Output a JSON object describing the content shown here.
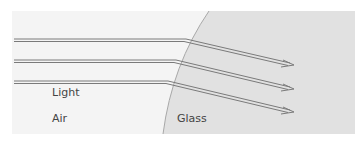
{
  "diagram": {
    "labels": {
      "light": "Light",
      "air": "Air",
      "glass": "Glass"
    },
    "media": [
      {
        "name": "Air",
        "color": "#f4f4f4"
      },
      {
        "name": "Glass",
        "color": "#e1e1e1"
      }
    ],
    "rays": [
      {
        "id": 1,
        "incident_y": 40,
        "hit": [
          185,
          40
        ],
        "end": [
          293,
          65
        ]
      },
      {
        "id": 2,
        "incident_y": 61,
        "hit": [
          175,
          61
        ],
        "end": [
          293,
          89
        ]
      },
      {
        "id": 3,
        "incident_y": 82,
        "hit": [
          167,
          82
        ],
        "end": [
          293,
          112
        ]
      }
    ],
    "colors": {
      "ray": "#7a7a7a",
      "boundary": "#a8a8a8",
      "text": "#444444"
    }
  }
}
